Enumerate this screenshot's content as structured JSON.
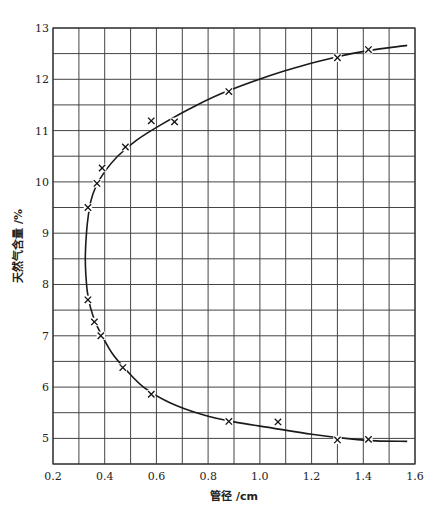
{
  "chart_data": {
    "type": "scatter",
    "title": "",
    "xlabel": "管径 /cm",
    "ylabel": "天然气含量 /%",
    "xlim": [
      0.2,
      1.6
    ],
    "ylim": [
      4.5,
      13
    ],
    "grid": true,
    "x_ticks": [
      0.2,
      0.4,
      0.6,
      0.8,
      1.0,
      1.2,
      1.4,
      1.6
    ],
    "x_tick_labels": [
      "0.2",
      "0.4",
      "0.6",
      "0.8",
      "1.0",
      "1.2",
      "1.4",
      "1.6"
    ],
    "y_ticks": [
      5,
      6,
      7,
      8,
      9,
      10,
      11,
      12,
      13
    ],
    "y_tick_labels": [
      "5",
      "6",
      "7",
      "8",
      "9",
      "10",
      "11",
      "12",
      "13"
    ],
    "grid_x_step": 0.1,
    "grid_y_step": 0.5,
    "series": [
      {
        "name": "measured",
        "marker": "x",
        "points": [
          {
            "x": 1.42,
            "y": 12.58
          },
          {
            "x": 1.3,
            "y": 12.42
          },
          {
            "x": 0.88,
            "y": 11.76
          },
          {
            "x": 0.67,
            "y": 11.17
          },
          {
            "x": 0.58,
            "y": 11.19
          },
          {
            "x": 0.48,
            "y": 10.68
          },
          {
            "x": 0.39,
            "y": 10.27
          },
          {
            "x": 0.37,
            "y": 9.97
          },
          {
            "x": 0.335,
            "y": 9.5
          },
          {
            "x": 0.335,
            "y": 7.7
          },
          {
            "x": 0.36,
            "y": 7.27
          },
          {
            "x": 0.385,
            "y": 7.0
          },
          {
            "x": 0.47,
            "y": 6.38
          },
          {
            "x": 0.58,
            "y": 5.86
          },
          {
            "x": 0.88,
            "y": 5.33
          },
          {
            "x": 1.07,
            "y": 5.32
          },
          {
            "x": 1.3,
            "y": 4.97
          },
          {
            "x": 1.42,
            "y": 4.98
          }
        ]
      },
      {
        "name": "fitted curve",
        "type": "line",
        "points": [
          {
            "x": 1.57,
            "y": 12.66
          },
          {
            "x": 1.42,
            "y": 12.56
          },
          {
            "x": 1.3,
            "y": 12.44
          },
          {
            "x": 1.1,
            "y": 12.17
          },
          {
            "x": 0.88,
            "y": 11.78
          },
          {
            "x": 0.75,
            "y": 11.48
          },
          {
            "x": 0.62,
            "y": 11.12
          },
          {
            "x": 0.52,
            "y": 10.8
          },
          {
            "x": 0.45,
            "y": 10.5
          },
          {
            "x": 0.4,
            "y": 10.2
          },
          {
            "x": 0.365,
            "y": 9.9
          },
          {
            "x": 0.345,
            "y": 9.6
          },
          {
            "x": 0.333,
            "y": 9.2
          },
          {
            "x": 0.327,
            "y": 8.8
          },
          {
            "x": 0.325,
            "y": 8.5
          },
          {
            "x": 0.327,
            "y": 8.2
          },
          {
            "x": 0.333,
            "y": 7.85
          },
          {
            "x": 0.345,
            "y": 7.55
          },
          {
            "x": 0.365,
            "y": 7.25
          },
          {
            "x": 0.39,
            "y": 7.0
          },
          {
            "x": 0.43,
            "y": 6.65
          },
          {
            "x": 0.48,
            "y": 6.35
          },
          {
            "x": 0.55,
            "y": 6.0
          },
          {
            "x": 0.65,
            "y": 5.7
          },
          {
            "x": 0.78,
            "y": 5.46
          },
          {
            "x": 0.9,
            "y": 5.32
          },
          {
            "x": 1.05,
            "y": 5.2
          },
          {
            "x": 1.2,
            "y": 5.08
          },
          {
            "x": 1.35,
            "y": 4.99
          },
          {
            "x": 1.45,
            "y": 4.95
          },
          {
            "x": 1.57,
            "y": 4.94
          }
        ]
      }
    ]
  },
  "labels": {
    "xlabel": "管径 /cm",
    "ylabel": "天然气含量 /%"
  }
}
